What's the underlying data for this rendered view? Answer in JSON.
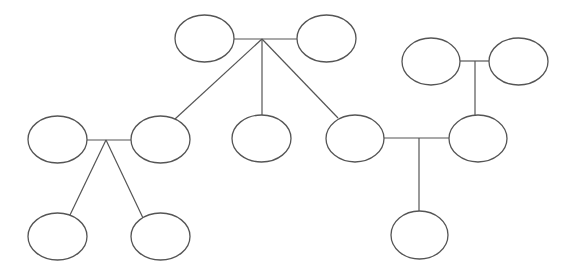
{
  "diagram": {
    "type": "family-tree",
    "colors": {
      "stroke": "#555555",
      "background": "#ffffff",
      "node_fill": "#ffffff"
    },
    "nodes": [
      {
        "id": "gp-a1",
        "cx": 204.5,
        "cy": 38.5,
        "rx": 29.5,
        "ry": 23.5
      },
      {
        "id": "gp-a2",
        "cx": 326.5,
        "cy": 38.5,
        "rx": 29.5,
        "ry": 23.5
      },
      {
        "id": "gp-b1",
        "cx": 431,
        "cy": 61.5,
        "rx": 29,
        "ry": 23.5
      },
      {
        "id": "gp-b2",
        "cx": 518.5,
        "cy": 61.5,
        "rx": 29.5,
        "ry": 23.5
      },
      {
        "id": "spouse-left",
        "cx": 57.5,
        "cy": 139.5,
        "rx": 29.5,
        "ry": 23.5
      },
      {
        "id": "child-a1",
        "cx": 160.5,
        "cy": 139.5,
        "rx": 29.5,
        "ry": 23.5
      },
      {
        "id": "child-a2",
        "cx": 261.5,
        "cy": 138.5,
        "rx": 29.5,
        "ry": 23.5
      },
      {
        "id": "child-a3",
        "cx": 355,
        "cy": 138.5,
        "rx": 29,
        "ry": 23.5
      },
      {
        "id": "child-b1",
        "cx": 478,
        "cy": 138.5,
        "rx": 29,
        "ry": 23.5
      },
      {
        "id": "grandchild-1",
        "cx": 57.5,
        "cy": 236.5,
        "rx": 29.5,
        "ry": 23.5
      },
      {
        "id": "grandchild-2",
        "cx": 160.5,
        "cy": 236.5,
        "rx": 29.5,
        "ry": 23.5
      },
      {
        "id": "grandchild-3",
        "cx": 419.5,
        "cy": 235,
        "rx": 28.5,
        "ry": 24
      }
    ],
    "edges": [
      {
        "id": "marriage-a",
        "x1": 234,
        "y1": 39,
        "x2": 297,
        "y2": 39
      },
      {
        "id": "descent-a-1",
        "x1": 262,
        "y1": 39,
        "x2": 175,
        "y2": 119
      },
      {
        "id": "descent-a-2",
        "x1": 262,
        "y1": 39,
        "x2": 262,
        "y2": 115
      },
      {
        "id": "descent-a-3",
        "x1": 262,
        "y1": 39,
        "x2": 338,
        "y2": 118
      },
      {
        "id": "marriage-b",
        "x1": 460,
        "y1": 61,
        "x2": 489,
        "y2": 61
      },
      {
        "id": "descent-b-1",
        "x1": 475,
        "y1": 61,
        "x2": 475,
        "y2": 115
      },
      {
        "id": "marriage-left",
        "x1": 87,
        "y1": 140,
        "x2": 131,
        "y2": 140
      },
      {
        "id": "descent-left-1",
        "x1": 106,
        "y1": 140,
        "x2": 70,
        "y2": 215
      },
      {
        "id": "descent-left-2",
        "x1": 106,
        "y1": 140,
        "x2": 143,
        "y2": 218
      },
      {
        "id": "marriage-right",
        "x1": 384,
        "y1": 138,
        "x2": 449,
        "y2": 138
      },
      {
        "id": "descent-right-1",
        "x1": 419,
        "y1": 138,
        "x2": 419,
        "y2": 211
      }
    ]
  }
}
